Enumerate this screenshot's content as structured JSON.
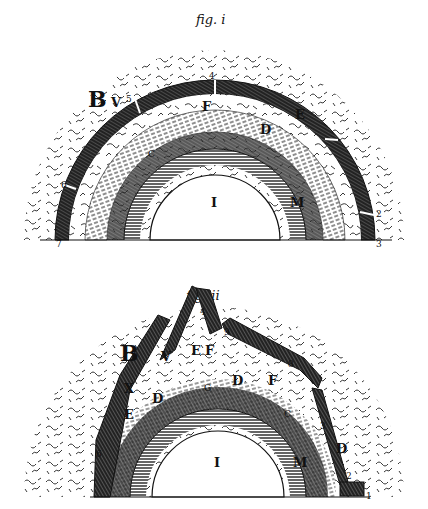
{
  "figures": [
    {
      "caption": "fig. i",
      "labels": {
        "B": "B",
        "V": "V",
        "n5": "5",
        "n4": "4",
        "F": "F",
        "D": "D",
        "E": "E",
        "C": "C",
        "I": "I",
        "M": "M",
        "n6": "6",
        "n7": "7",
        "n2": "2",
        "n3": "3"
      }
    },
    {
      "caption": "fig. ii",
      "labels": {
        "B": "B",
        "V": "V",
        "E": "E",
        "F": "F",
        "F2": "F",
        "D_top": "D",
        "X": "X",
        "D_left": "D",
        "E_left": "E",
        "C": "C",
        "D_right": "D",
        "I": "I",
        "M": "M",
        "n4": "4",
        "n9": "9",
        "n8": "8",
        "n3": "3",
        "n1": "1",
        "n2": "2",
        "n6": "6",
        "G": "G"
      }
    }
  ],
  "colors": {
    "ink": "#111111",
    "paper": "#ffffff",
    "hatch": "#333333"
  }
}
